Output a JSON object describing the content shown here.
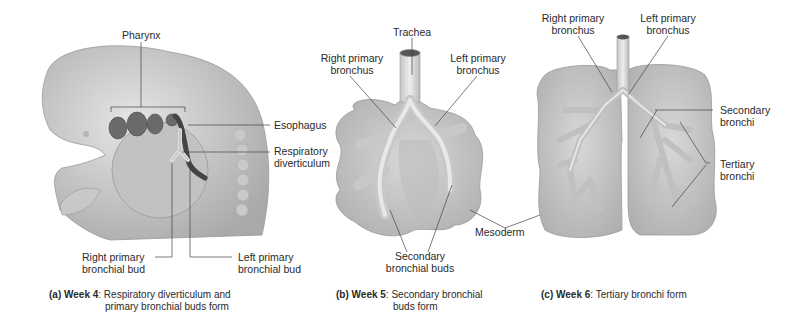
{
  "panels": [
    {
      "id": "a",
      "caption_prefix": "(a)",
      "caption_week": "Week 4",
      "caption_text_line1": ": Respiratory diverticulum and",
      "caption_text_line2": "primary bronchial buds form",
      "labels": {
        "pharynx": "Pharynx",
        "esophagus": "Esophagus",
        "respiratory_diverticulum_1": "Respiratory",
        "respiratory_diverticulum_2": "diverticulum",
        "right_bud_1": "Right primary",
        "right_bud_2": "bronchial bud",
        "left_bud_1": "Left primary",
        "left_bud_2": "bronchial bud"
      }
    },
    {
      "id": "b",
      "caption_prefix": "(b)",
      "caption_week": "Week 5",
      "caption_text_line1": ": Secondary bronchial",
      "caption_text_line2": "buds form",
      "labels": {
        "trachea": "Trachea",
        "right_primary_1": "Right primary",
        "right_primary_2": "bronchus",
        "left_primary_1": "Left primary",
        "left_primary_2": "bronchus",
        "secondary_buds_1": "Secondary",
        "secondary_buds_2": "bronchial buds",
        "mesoderm": "Mesoderm"
      }
    },
    {
      "id": "c",
      "caption_prefix": "(c)",
      "caption_week": "Week 6",
      "caption_text_line1": ": Tertiary bronchi form",
      "labels": {
        "right_primary_1": "Right primary",
        "right_primary_2": "bronchus",
        "left_primary_1": "Left primary",
        "left_primary_2": "bronchus",
        "secondary_1": "Secondary",
        "secondary_2": "bronchi",
        "tertiary_1": "Tertiary",
        "tertiary_2": "bronchi"
      }
    }
  ]
}
